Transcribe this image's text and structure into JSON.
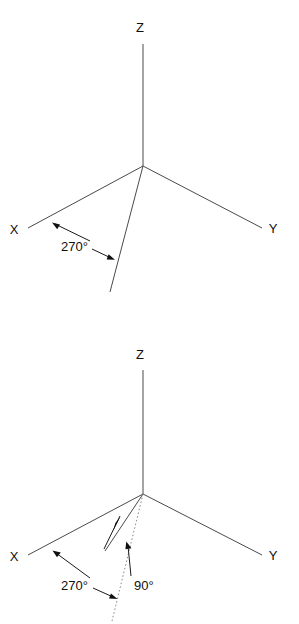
{
  "page": {
    "background_color": "#ffffff",
    "width": 299,
    "height": 624,
    "line_color": "#4a4a4a",
    "dotted_line_color": "#8c8c8c",
    "text_color": "#101010"
  },
  "diagrams": [
    {
      "id": "top",
      "name": "axes-with-270-degree-rotation",
      "origin": {
        "x": 143,
        "y": 166
      },
      "axes": [
        {
          "name": "Z",
          "label": "Z",
          "label_x": 140,
          "label_y": 32,
          "end_x": 143,
          "end_y": 44
        },
        {
          "name": "X",
          "label": "X",
          "label_x": 14,
          "label_y": 234,
          "end_x": 28,
          "end_y": 228
        },
        {
          "name": "Y",
          "label": "Y",
          "label_x": 266,
          "label_y": 233,
          "end_x": 262,
          "end_y": 228
        }
      ],
      "rays": [
        {
          "name": "rotated-ray",
          "style": "solid",
          "end_x": 110,
          "end_y": 292
        }
      ],
      "annotations": [
        {
          "name": "angle-270",
          "text": "270°",
          "text_x": 61,
          "text_y": 251,
          "leader_from_x": 90,
          "leader_from_y": 241,
          "leader_to_x": 53,
          "leader_to_y": 223,
          "arrow_x": 53,
          "arrow_y": 223,
          "leader2_from_x": 92,
          "leader2_from_y": 249,
          "leader2_to_x": 114,
          "leader2_to_y": 259,
          "arrow2_x": 114,
          "arrow2_y": 259
        }
      ]
    },
    {
      "id": "bottom",
      "name": "axes-with-270-and-90-degree-rotation",
      "origin": {
        "x": 143,
        "y": 494
      },
      "axes": [
        {
          "name": "Z",
          "label": "Z",
          "label_x": 140,
          "label_y": 359,
          "end_x": 143,
          "end_y": 370
        },
        {
          "name": "X",
          "label": "X",
          "label_x": 14,
          "label_y": 561,
          "end_x": 28,
          "end_y": 555
        },
        {
          "name": "Y",
          "label": "Y",
          "label_x": 266,
          "label_y": 560,
          "end_x": 262,
          "end_y": 555
        }
      ],
      "rays": [
        {
          "name": "rotated-ray-solid",
          "style": "solid",
          "end_x": 105,
          "end_y": 551
        },
        {
          "name": "rotated-ray-dotted",
          "style": "dotted",
          "end_x": 112,
          "end_y": 621
        }
      ],
      "annotations": [
        {
          "name": "angle-270",
          "text": "270°",
          "text_x": 61,
          "text_y": 590,
          "leader_from_x": 90,
          "leader_from_y": 578,
          "leader_to_x": 53,
          "leader_to_y": 551,
          "arrow_x": 53,
          "arrow_y": 551,
          "leader2_from_x": 93,
          "leader2_from_y": 588,
          "leader2_to_x": 116,
          "leader2_to_y": 598,
          "arrow2_x": 116,
          "arrow2_y": 598
        },
        {
          "name": "angle-90",
          "text": "90°",
          "text_x": 134,
          "text_y": 590,
          "leader_from_x": 105,
          "leader_from_y": 549,
          "leader_to_x": 121,
          "leader_to_y": 516,
          "arrow_x": 114,
          "arrow_y": 530,
          "leader2_from_x": 130,
          "leader2_from_y": 578,
          "leader2_to_x": 127,
          "leader2_to_y": 542,
          "arrow2_x": 127,
          "arrow2_y": 542
        }
      ]
    }
  ]
}
